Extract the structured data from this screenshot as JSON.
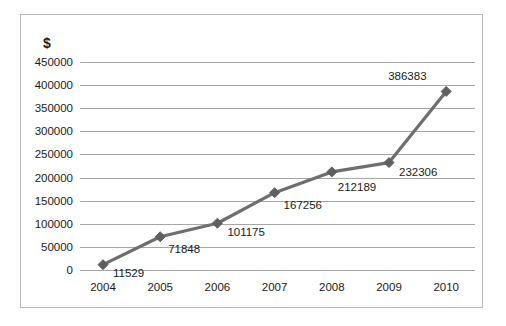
{
  "chart_data": {
    "type": "line",
    "title": "",
    "subtitle": "",
    "xlabel": "",
    "ylabel": "$",
    "categories": [
      "2004",
      "2005",
      "2006",
      "2007",
      "2008",
      "2009",
      "2010"
    ],
    "values": [
      11529,
      71848,
      101175,
      167256,
      212189,
      232306,
      386383
    ],
    "data_labels": [
      "11529",
      "71848",
      "101175",
      "167256",
      "212189",
      "232306",
      "386383"
    ],
    "series": [
      {
        "name": "",
        "values": [
          11529,
          71848,
          101175,
          167256,
          212189,
          232306,
          386383
        ],
        "color": "#6e6e6e",
        "marker": "diamond"
      }
    ],
    "ylim": [
      0,
      450000
    ],
    "y_ticks": [
      450000,
      400000,
      350000,
      300000,
      250000,
      200000,
      150000,
      100000,
      50000,
      0
    ],
    "y_tick_labels": [
      "450000",
      "400000",
      "350000",
      "300000",
      "250000",
      "200000",
      "150000",
      "100000",
      "50000",
      "0"
    ],
    "grid": true,
    "grid_axis": "y",
    "legend": false,
    "legend_position": "none",
    "plot_background": "#ffffff",
    "border_color": "#b9b9b9",
    "gridline_color": "#a6a6a6",
    "text_color": "#1a1a1a"
  },
  "label_offsets": [
    {
      "dx": 10,
      "dy": 12
    },
    {
      "dx": 8,
      "dy": 16
    },
    {
      "dx": 10,
      "dy": 13
    },
    {
      "dx": 9,
      "dy": 16
    },
    {
      "dx": 6,
      "dy": 19
    },
    {
      "dx": 10,
      "dy": 13
    },
    {
      "dx": -58,
      "dy": -11
    }
  ]
}
